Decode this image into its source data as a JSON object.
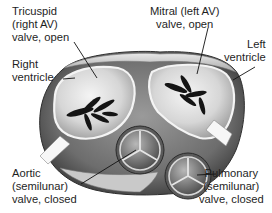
{
  "diagram": {
    "style": "grayscale medical illustration",
    "labels": {
      "tricuspid": "Tricuspid\n(right AV)\nvalve, open",
      "right_ventricle": "Right\nventricle",
      "mitral": "Mitral (left AV)\nvalve, open",
      "left_ventricle": "Left\nventricle",
      "aortic": "Aortic\n(semilunar)\nvalve, closed",
      "pulmonary": "Pulmonary\n(semilunar)\nvalve, closed"
    },
    "structures": [
      {
        "name": "Tricuspid valve",
        "state": "open"
      },
      {
        "name": "Mitral valve",
        "state": "open"
      },
      {
        "name": "Aortic valve",
        "state": "closed"
      },
      {
        "name": "Pulmonary valve",
        "state": "closed"
      },
      {
        "name": "Right ventricle"
      },
      {
        "name": "Left ventricle"
      }
    ],
    "colors": {
      "background": "#ffffff",
      "text": "#1e1e1e",
      "leader_line": "#111111"
    }
  }
}
